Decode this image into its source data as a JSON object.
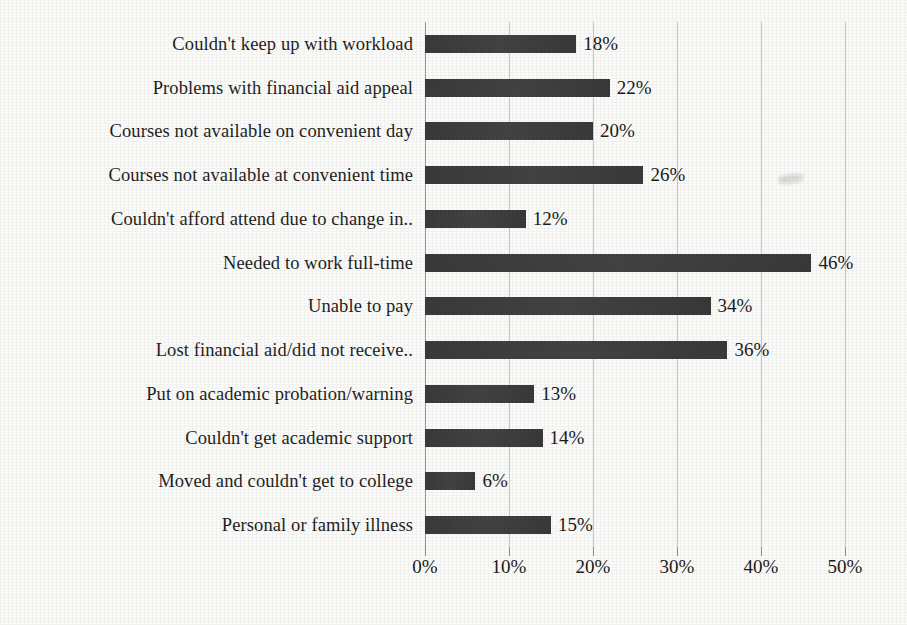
{
  "chart_data": {
    "type": "bar",
    "orientation": "horizontal",
    "title": "",
    "xlabel": "",
    "ylabel": "",
    "xlim": [
      0,
      50
    ],
    "xtick_labels": [
      "0%",
      "10%",
      "20%",
      "30%",
      "40%",
      "50%"
    ],
    "xticks": [
      0,
      10,
      20,
      30,
      40,
      50
    ],
    "grid": true,
    "legend": "none",
    "value_label_suffix": "%",
    "bar_color": "#3c3c3c",
    "gridline_color": "#c9c9c6",
    "background_color": "#fbfbf9",
    "categories": [
      "Couldn't keep up with workload",
      "Problems with financial aid appeal",
      "Courses not available on convenient day",
      "Courses not available at convenient time",
      "Couldn't afford attend due to change in..",
      "Needed to work full-time",
      "Unable to pay",
      "Lost financial aid/did not receive..",
      "Put on academic probation/warning",
      "Couldn't get academic support",
      "Moved and couldn't get to college",
      "Personal or family illness"
    ],
    "values": [
      18,
      22,
      20,
      26,
      12,
      46,
      34,
      36,
      13,
      14,
      6,
      15
    ],
    "value_labels": [
      "18%",
      "22%",
      "20%",
      "26%",
      "12%",
      "46%",
      "34%",
      "36%",
      "13%",
      "14%",
      "6%",
      "15%"
    ]
  }
}
